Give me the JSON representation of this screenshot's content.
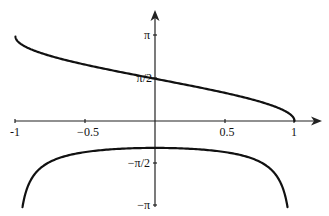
{
  "chart_data": {
    "type": "line",
    "title": "",
    "xlabel": "",
    "ylabel": "",
    "xlim": [
      -1,
      1
    ],
    "ylim": [
      -3.14159,
      3.14159
    ],
    "grid": false,
    "legend": null,
    "x_ticks": [
      {
        "value": -1,
        "label": "-1"
      },
      {
        "value": -0.5,
        "label": "−0.5"
      },
      {
        "value": 0.5,
        "label": "0.5"
      },
      {
        "value": 1,
        "label": "1"
      }
    ],
    "y_ticks": [
      {
        "value": 3.14159,
        "label": "π"
      },
      {
        "value": 1.5708,
        "label": "π/2"
      },
      {
        "value": -1.5708,
        "label": "−π/2"
      },
      {
        "value": -3.14159,
        "label": "−π"
      }
    ],
    "series": [
      {
        "name": "arccos(x)",
        "x": [
          -1,
          -0.9,
          -0.75,
          -0.5,
          -0.25,
          0,
          0.25,
          0.5,
          0.75,
          0.9,
          1
        ],
        "y": [
          3.14,
          2.69,
          2.42,
          2.09,
          1.82,
          1.57,
          1.32,
          1.05,
          0.72,
          0.45,
          0
        ]
      },
      {
        "name": "-1/sqrt(1-x^2)",
        "x": [
          -0.95,
          -0.9,
          -0.75,
          -0.5,
          -0.25,
          0,
          0.25,
          0.5,
          0.75,
          0.9,
          0.95
        ],
        "y": [
          -3.2,
          -2.29,
          -1.51,
          -1.15,
          -1.03,
          -1.0,
          -1.03,
          -1.15,
          -1.51,
          -2.29,
          -3.2
        ]
      }
    ]
  },
  "labels": {
    "x_neg1": "-1",
    "x_neg05": "−0.5",
    "x_05": "0.5",
    "x_1": "1",
    "y_pi": "π",
    "y_pi2": "π/2",
    "y_negpi2": "−π/2",
    "y_negpi": "−π"
  }
}
